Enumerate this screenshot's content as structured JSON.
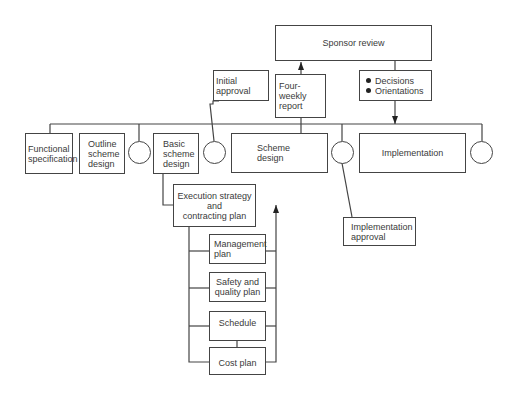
{
  "diagram": {
    "top": {
      "sponsor_review": "Sponsor review",
      "four_weekly_report": "Four-weekly\nreport",
      "decisions": [
        "Decisions",
        "Orientations"
      ],
      "initial_approval": "Initial approval"
    },
    "phases": [
      {
        "id": "functional",
        "label": "Functional\nspecification"
      },
      {
        "id": "outline",
        "label": "Outline\nscheme\ndesign"
      },
      {
        "id": "basic",
        "label": "Basic\nscheme\ndesign"
      },
      {
        "id": "scheme",
        "label": "Scheme\ndesign"
      },
      {
        "id": "implementation",
        "label": "Implementation"
      }
    ],
    "execution": {
      "strategy": "Execution strategy\nand\ncontracting plan",
      "plans": [
        "Management\nplan",
        "Safety and\nquality plan",
        "Schedule",
        "Cost plan"
      ]
    },
    "implementation_approval": "Implementation\napproval"
  }
}
